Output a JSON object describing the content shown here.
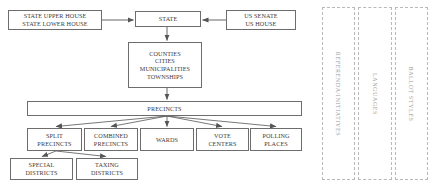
{
  "diagram": {
    "colors": {
      "box_border": "#6d6d6d",
      "dashed_border": "#b9b9b9",
      "text": "#3a3a3a",
      "dashed_text": "#9a9a9a",
      "connector": "#555555",
      "background": "#ffffff"
    },
    "nodes": [
      {
        "id": "legislature",
        "lines": [
          "STATE UPPER HOUSE",
          "STATE LOWER HOUSE"
        ],
        "x": 8,
        "y": 10,
        "w": 94,
        "h": 20
      },
      {
        "id": "state",
        "lines": [
          "STATE"
        ],
        "x": 135,
        "y": 11,
        "w": 66,
        "h": 16
      },
      {
        "id": "congress",
        "lines": [
          "US SENATE",
          "US HOUSE"
        ],
        "x": 226,
        "y": 10,
        "w": 70,
        "h": 20
      },
      {
        "id": "local-governments",
        "lines": [
          "COUNTIES",
          "CITIES",
          "MUNICIPALITIES",
          "TOWNSHIPS"
        ],
        "x": 128,
        "y": 42,
        "w": 74,
        "h": 46
      },
      {
        "id": "precincts",
        "lines": [
          "PRECINCTS"
        ],
        "x": 27,
        "y": 101,
        "w": 275,
        "h": 15
      },
      {
        "id": "split-precincts",
        "lines": [
          "SPLIT",
          "PRECINCTS"
        ],
        "x": 27,
        "y": 128,
        "w": 55,
        "h": 23
      },
      {
        "id": "combined-precincts",
        "lines": [
          "COMBINED",
          "PRECINCTS"
        ],
        "x": 84,
        "y": 128,
        "w": 54,
        "h": 23
      },
      {
        "id": "wards",
        "lines": [
          "WARDS"
        ],
        "x": 140,
        "y": 128,
        "w": 54,
        "h": 23
      },
      {
        "id": "vote-centers",
        "lines": [
          "VOTE",
          "CENTERS"
        ],
        "x": 196,
        "y": 128,
        "w": 53,
        "h": 23
      },
      {
        "id": "polling-places",
        "lines": [
          "POLLING",
          "PLACES"
        ],
        "x": 250,
        "y": 128,
        "w": 52,
        "h": 23
      },
      {
        "id": "special-districts",
        "lines": [
          "SPECIAL",
          "DISTRICTS"
        ],
        "x": 10,
        "y": 158,
        "w": 63,
        "h": 22
      },
      {
        "id": "taxing-districts",
        "lines": [
          "TAXING",
          "DISTRICTS"
        ],
        "x": 76,
        "y": 158,
        "w": 62,
        "h": 22
      }
    ],
    "dashed_panels": [
      {
        "id": "referenda-initiatives",
        "label": "REFERENDA/INITIATIVES",
        "x": 322,
        "y": 7,
        "w": 33,
        "h": 173
      },
      {
        "id": "languages",
        "label": "LANGUAGES",
        "x": 358,
        "y": 7,
        "w": 34,
        "h": 173
      },
      {
        "id": "ballot-styles",
        "label": "BALLOT STYLES",
        "x": 395,
        "y": 7,
        "w": 33,
        "h": 173
      }
    ],
    "connectors": [
      {
        "id": "legislature-to-state",
        "from": "legislature",
        "to": "state",
        "type": "arrow-right"
      },
      {
        "id": "congress-to-state",
        "from": "congress",
        "to": "state",
        "type": "arrow-left"
      },
      {
        "id": "state-to-local",
        "from": "state",
        "to": "local-governments",
        "type": "arrow-down"
      },
      {
        "id": "local-to-precincts",
        "from": "local-governments",
        "to": "precincts",
        "type": "arrow-down"
      },
      {
        "id": "precincts-to-split",
        "from": "precincts",
        "to": "split-precincts",
        "type": "arrow-fan"
      },
      {
        "id": "precincts-to-combined",
        "from": "precincts",
        "to": "combined-precincts",
        "type": "arrow-fan"
      },
      {
        "id": "precincts-to-wards",
        "from": "precincts",
        "to": "wards",
        "type": "arrow-fan"
      },
      {
        "id": "precincts-to-vote-centers",
        "from": "precincts",
        "to": "vote-centers",
        "type": "arrow-fan"
      },
      {
        "id": "precincts-to-polling-places",
        "from": "precincts",
        "to": "polling-places",
        "type": "arrow-fan"
      },
      {
        "id": "split-to-special",
        "from": "split-precincts",
        "to": "special-districts",
        "type": "arrow-fan"
      },
      {
        "id": "split-to-taxing",
        "from": "split-precincts",
        "to": "taxing-districts",
        "type": "arrow-fan"
      }
    ]
  }
}
